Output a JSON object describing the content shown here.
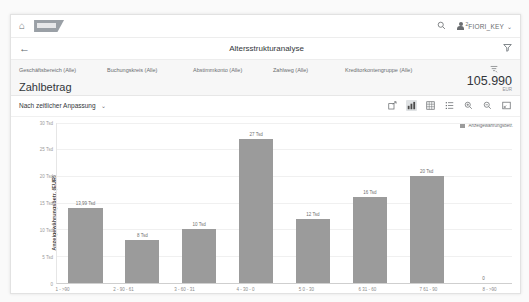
{
  "shellbar": {
    "home_icon": "home-icon",
    "logo": "SAP",
    "search_icon": "search-icon",
    "user_superscript": "2",
    "user_name": "FIORI_KEY",
    "chevron": "⌄"
  },
  "titlebar": {
    "back_icon": "←",
    "title": "Altersstrukturanalyse",
    "filter_icon": "filter-funnel-icon"
  },
  "filterbar": {
    "filters": [
      "Geschäftsbereich (Alle)",
      "Buchungskreis (Alle)",
      "Abstimmkonto (Alle)",
      "Zahlweg (Alle)",
      "Kreditorkontengruppe (Alle)"
    ],
    "adapt_filters_icon": "filter-settings-icon",
    "kpi_label": "Zahlbetrag",
    "kpi_amount": "105.990",
    "kpi_unit": "EUR"
  },
  "chart_toolbar": {
    "dimension_label": "Nach zeitlicher Anpassung",
    "dimension_chevron": "⌄",
    "icons": [
      {
        "name": "share-icon",
        "active": false
      },
      {
        "name": "bar-chart-icon",
        "active": true
      },
      {
        "name": "table-grid-icon",
        "active": false
      },
      {
        "name": "list-icon",
        "active": false
      },
      {
        "name": "zoom-in-icon",
        "active": false
      },
      {
        "name": "zoom-out-icon",
        "active": false
      },
      {
        "name": "fullscreen-icon",
        "active": false
      }
    ]
  },
  "chart_data": {
    "type": "bar",
    "title": "",
    "xlabel": "Altersraster",
    "ylabel": "Anzeigewährungsbetr. (EUR)",
    "legend": [
      "Anzeigewährungsbetr."
    ],
    "legend_position": "top-right",
    "grid": true,
    "ylim": [
      0,
      30000
    ],
    "yticks": [
      0,
      5000,
      10000,
      15000,
      20000,
      25000,
      30000
    ],
    "ytick_labels": [
      "0",
      "5 Tsd",
      "10 Tsd",
      "15 Tsd",
      "20 Tsd",
      "25 Tsd",
      "30 Tsd"
    ],
    "categories": [
      "1 - >90",
      "2 - 90 - 61",
      "3 - 60 - 31",
      "4 - 30 - 0",
      "5 0 - 30",
      "6 31 - 60",
      "7 61 - 90",
      "8 - >90"
    ],
    "values": [
      13990,
      8000,
      10000,
      27000,
      12000,
      16000,
      20000,
      0
    ],
    "value_labels": [
      "13,99 Tsd",
      "8 Tsd",
      "10 Tsd",
      "27 Tsd",
      "12 Tsd",
      "16 Tsd",
      "20 Tsd",
      "0"
    ],
    "bar_color": "#9b9b9b"
  }
}
